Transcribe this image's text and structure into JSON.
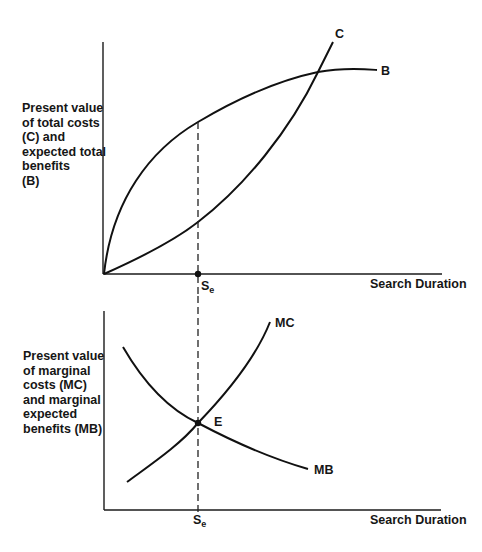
{
  "top_panel": {
    "y_axis_label_lines": [
      "Present value",
      "of total costs",
      "(C) and",
      "expected total",
      "benefits",
      "(B)"
    ],
    "x_axis_label": "Search Duration",
    "curves": [
      {
        "name": "C",
        "label": "C",
        "description": "Present value of total costs, convex, starts at origin"
      },
      {
        "name": "B",
        "label": "B",
        "description": "Expected total benefits, concave, starts at origin"
      }
    ],
    "marker": {
      "label": "S",
      "subscript": "e"
    }
  },
  "bottom_panel": {
    "y_axis_label_lines": [
      "Present value",
      "of marginal",
      "costs (MC)",
      "and marginal",
      "expected",
      "benefits (MB)"
    ],
    "x_axis_label": "Search Duration",
    "curves": [
      {
        "name": "MC",
        "label": "MC",
        "description": "Marginal costs, rising"
      },
      {
        "name": "MB",
        "label": "MB",
        "description": "Marginal expected benefits, falling"
      }
    ],
    "equilibrium": {
      "label": "E"
    },
    "marker": {
      "label": "S",
      "subscript": "e"
    }
  },
  "colors": {
    "line": "#111111",
    "background": "#ffffff"
  }
}
